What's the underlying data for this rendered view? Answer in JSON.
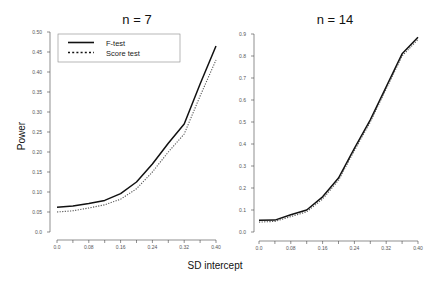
{
  "chart_data": [
    {
      "type": "line",
      "title": "n = 7",
      "xlabel": "SD intercept",
      "ylabel": "Power",
      "x": [
        0.0,
        0.04,
        0.08,
        0.12,
        0.16,
        0.2,
        0.24,
        0.28,
        0.32,
        0.36,
        0.4
      ],
      "xticks": [
        0.0,
        0.04,
        0.08,
        0.12,
        0.16,
        0.2,
        0.24,
        0.28,
        0.32,
        0.36,
        0.4
      ],
      "xtick_labels": [
        "0.0",
        "0.08",
        "0.16",
        "0.24",
        "0.32",
        "0.40"
      ],
      "xtick_label_values": [
        0.0,
        0.08,
        0.16,
        0.24,
        0.32,
        0.4
      ],
      "ylim": [
        0.0,
        0.5
      ],
      "xlim": [
        0.0,
        0.4
      ],
      "yticks": [
        0.0,
        0.05,
        0.1,
        0.15,
        0.2,
        0.25,
        0.3,
        0.35,
        0.4,
        0.45,
        0.5
      ],
      "ytick_labels": [
        "0.0",
        "0.05",
        "0.10",
        "0.15",
        "0.20",
        "0.25",
        "0.30",
        "0.35",
        "0.40",
        "0.45",
        "0.50"
      ],
      "grid": false,
      "legend_position": "top-left",
      "series": [
        {
          "name": "F-test",
          "style": "solid",
          "values": [
            0.062,
            0.065,
            0.071,
            0.079,
            0.096,
            0.125,
            0.17,
            0.222,
            0.27,
            0.37,
            0.465
          ]
        },
        {
          "name": "Score test",
          "style": "dotted",
          "values": [
            0.05,
            0.053,
            0.06,
            0.068,
            0.082,
            0.108,
            0.15,
            0.2,
            0.245,
            0.34,
            0.43
          ]
        }
      ]
    },
    {
      "type": "line",
      "title": "n = 14",
      "xlabel": "SD intercept",
      "ylabel": "Power",
      "x": [
        0.0,
        0.04,
        0.08,
        0.12,
        0.16,
        0.2,
        0.24,
        0.28,
        0.32,
        0.36,
        0.4
      ],
      "xticks": [
        0.0,
        0.04,
        0.08,
        0.12,
        0.16,
        0.2,
        0.24,
        0.28,
        0.32,
        0.36,
        0.4
      ],
      "xtick_labels": [
        "0.0",
        "0.08",
        "0.16",
        "0.24",
        "0.32",
        "0.40"
      ],
      "xtick_label_values": [
        0.0,
        0.08,
        0.16,
        0.24,
        0.32,
        0.4
      ],
      "ylim": [
        0.0,
        0.9
      ],
      "xlim": [
        0.0,
        0.4
      ],
      "yticks": [
        0.0,
        0.1,
        0.2,
        0.3,
        0.4,
        0.5,
        0.6,
        0.7,
        0.8,
        0.9
      ],
      "ytick_labels": [
        "0.0",
        "0.1",
        "0.2",
        "0.3",
        "0.4",
        "0.5",
        "0.6",
        "0.7",
        "0.8",
        "0.9"
      ],
      "grid": false,
      "series": [
        {
          "name": "F-test",
          "style": "solid",
          "values": [
            0.053,
            0.054,
            0.078,
            0.1,
            0.16,
            0.245,
            0.38,
            0.51,
            0.66,
            0.81,
            0.885
          ]
        },
        {
          "name": "Score test",
          "style": "dotted",
          "values": [
            0.045,
            0.048,
            0.07,
            0.092,
            0.15,
            0.235,
            0.37,
            0.5,
            0.65,
            0.8,
            0.875
          ]
        }
      ]
    }
  ],
  "figure": {
    "xlabel": "SD intercept",
    "ylabel": "Power",
    "legend": [
      {
        "label": "F-test",
        "style": "solid"
      },
      {
        "label": "Score test",
        "style": "dotted"
      }
    ],
    "colors": {
      "f_test": "#111111",
      "score_test": "#555555",
      "axis": "#444444",
      "legend_border": "#888888"
    }
  }
}
